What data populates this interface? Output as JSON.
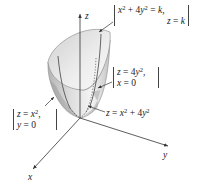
{
  "figure": {
    "type": "3d-surface-diagram",
    "surface_equation": "z = x^2 + 4y^2",
    "axes": {
      "x": "x",
      "y": "y",
      "z": "z"
    },
    "annotations": {
      "horizontal_trace": {
        "line1": {
          "lhs_a": "x",
          "exp_a": "2",
          "mid": " + 4",
          "lhs_b": "y",
          "exp_b": "2",
          "eq": " = ",
          "rhs": "k",
          "tail": ","
        },
        "line2": {
          "lhs": "z",
          "eq": " = ",
          "rhs": "k"
        }
      },
      "yz_trace": {
        "line1": {
          "lhs": "z",
          "eq": " = 4",
          "var": "y",
          "exp": "2",
          "tail": ","
        },
        "line2": {
          "lhs": "x",
          "eq": " = 0"
        }
      },
      "xz_trace": {
        "line1": {
          "lhs": "z",
          "eq": " = ",
          "var": "x",
          "exp": "2",
          "tail": ","
        },
        "line2": {
          "lhs": "y",
          "eq": " = 0"
        }
      },
      "surface_label": {
        "lhs": "z",
        "eq": " = ",
        "a": "x",
        "exp_a": "2",
        "mid": " + 4",
        "b": "y",
        "exp_b": "2"
      }
    },
    "colors": {
      "surface_light": "#f2f2f2",
      "surface_mid": "#d4d4d4",
      "surface_dark": "#a8a8a8",
      "axis": "#333333",
      "trace": "#555555"
    }
  }
}
